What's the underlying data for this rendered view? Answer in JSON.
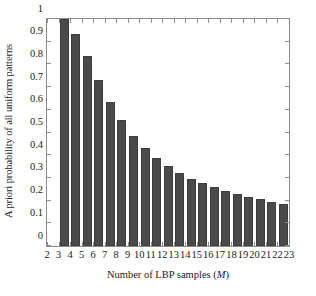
{
  "chart_data": {
    "type": "bar",
    "title": "",
    "xlabel": "Number of LBP samples (M)",
    "xlabel_plain": "Number of LBP samples",
    "xlabel_symbol": "M",
    "ylabel": "A priori probability of all uniform patterns",
    "categories": [
      3,
      4,
      5,
      6,
      7,
      8,
      9,
      10,
      11,
      12,
      13,
      14,
      15,
      16,
      17,
      18,
      19,
      20,
      21,
      22
    ],
    "values": [
      1.0,
      0.935,
      0.835,
      0.73,
      0.635,
      0.555,
      0.486,
      0.432,
      0.389,
      0.352,
      0.323,
      0.297,
      0.277,
      0.258,
      0.243,
      0.228,
      0.215,
      0.205,
      0.195,
      0.186
    ],
    "xlim": [
      2,
      23
    ],
    "ylim": [
      0,
      1
    ],
    "xticks": [
      2,
      3,
      4,
      5,
      6,
      7,
      8,
      9,
      10,
      11,
      12,
      13,
      14,
      15,
      16,
      17,
      18,
      19,
      20,
      21,
      22,
      23
    ],
    "xticklabels": [
      "2",
      "3",
      "4",
      "5",
      "6",
      "7",
      "8",
      "9",
      "10",
      "11",
      "12",
      "13",
      "14",
      "15",
      "16",
      "17",
      "18",
      "19",
      "20",
      "21",
      "22",
      "23"
    ],
    "yticks": [
      0,
      0.1,
      0.2,
      0.3,
      0.4,
      0.5,
      0.6,
      0.7,
      0.8,
      0.9,
      1
    ],
    "yticklabels": [
      "0",
      "0.1",
      "0.2",
      "0.3",
      "0.4",
      "0.5",
      "0.6",
      "0.7",
      "0.8",
      "0.9",
      "1"
    ],
    "grid": false,
    "legend": null,
    "bar_color": "#4a4a4a",
    "axis_color": "#8c8c8c"
  }
}
